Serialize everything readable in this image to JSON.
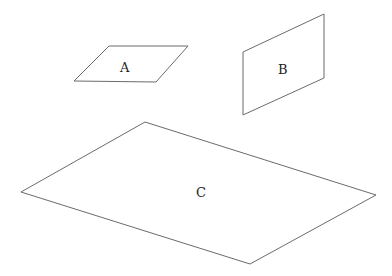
{
  "diagram": {
    "shapes": [
      {
        "id": "A",
        "label": "A",
        "points": "109,46 188,46 156,82 74,81",
        "label_pos": [
          125,
          68
        ]
      },
      {
        "id": "B",
        "label": "B",
        "points": "243,52 324,14 324,78 243,115",
        "label_pos": [
          283,
          70
        ]
      },
      {
        "id": "C",
        "label": "C",
        "points": "145,122 376,195 250,264 21,192",
        "label_pos": [
          201,
          196
        ]
      }
    ],
    "colors": {
      "stroke": "#6b6b6b",
      "text": "#222222",
      "background": "#ffffff"
    }
  }
}
